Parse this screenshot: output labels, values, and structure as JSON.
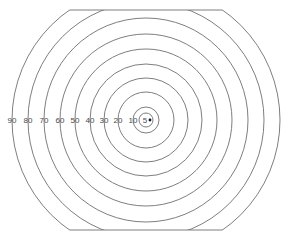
{
  "diagram": {
    "type": "concentric-ring-target",
    "center": {
      "x": 146,
      "y": 120
    },
    "clip": {
      "top_y": 10,
      "bottom_y": 230
    },
    "rings": [
      {
        "label": "5",
        "radius": 7
      },
      {
        "label": "10",
        "radius": 13
      },
      {
        "label": "20",
        "radius": 28
      },
      {
        "label": "30",
        "radius": 42
      },
      {
        "label": "40",
        "radius": 56
      },
      {
        "label": "50",
        "radius": 71
      },
      {
        "label": "60",
        "radius": 86
      },
      {
        "label": "70",
        "radius": 102
      },
      {
        "label": "80",
        "radius": 118
      },
      {
        "label": "90",
        "radius": 134
      }
    ],
    "line_color": "#6f6f6f",
    "label_color": "#4a4a4a",
    "center_marker": "dot"
  }
}
